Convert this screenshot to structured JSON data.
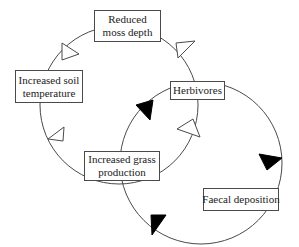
{
  "diagram": {
    "type": "feedback-loops",
    "loops": [
      {
        "name": "moss-soil-grass-herbivore loop",
        "arrow_style": "hollow",
        "sequence": [
          "Reduced moss depth",
          "Increased soil temperature",
          "Increased grass production",
          "Herbivores",
          "Reduced moss depth"
        ]
      },
      {
        "name": "herbivore-faecal-grass loop",
        "arrow_style": "filled",
        "sequence": [
          "Herbivores",
          "Faecal deposition",
          "Increased grass production",
          "Herbivores"
        ]
      }
    ],
    "colors": {
      "line": "#4a4a4a",
      "hollow_arrow_fill": "#ffffff",
      "filled_arrow_fill": "#000000",
      "box_border": "#4a4a4a",
      "text": "#222222"
    }
  },
  "nodes": {
    "moss": {
      "line1": "Reduced",
      "line2": "moss depth"
    },
    "soil": {
      "line1": "Increased soil",
      "line2": "temperature"
    },
    "herbivores": {
      "line1": "Herbivores"
    },
    "grass": {
      "line1": "Increased grass",
      "line2": "production"
    },
    "faecal": {
      "line1": "Faecal deposition"
    }
  }
}
